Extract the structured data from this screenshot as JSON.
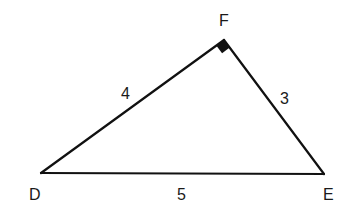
{
  "diagram": {
    "type": "right-triangle",
    "colors": {
      "stroke": "#111111",
      "text": "#1a1a1a",
      "background": "#ffffff"
    },
    "vertices": {
      "D": {
        "label": "D",
        "x": 41,
        "y": 173
      },
      "E": {
        "label": "E",
        "x": 324,
        "y": 174
      },
      "F": {
        "label": "F",
        "x": 224,
        "y": 40
      }
    },
    "sides": {
      "DF": {
        "label": "4"
      },
      "FE": {
        "label": "3"
      },
      "DE": {
        "label": "5"
      }
    },
    "right_angle_at": "F"
  }
}
